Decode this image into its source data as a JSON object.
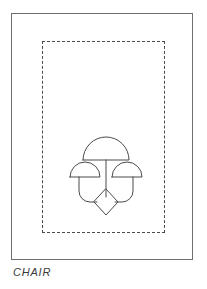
{
  "page": {
    "background_color": "#ffffff",
    "width": 207,
    "height": 289
  },
  "drawing_sheet": {
    "name": "drawing-sheet",
    "border_color": "#6e6e70",
    "border_style": "solid",
    "border_width_px": 1
  },
  "dashed_boundary": {
    "name": "dashed-boundary",
    "border_color": "#4a4a4c",
    "border_style": "dashed",
    "border_width_px": 1,
    "dash_length_px": 9,
    "gap_length_px": 5
  },
  "figure": {
    "name": "chair-icon",
    "stroke_color": "#4a4a4c",
    "fill_color": "none",
    "stroke_width_px": 1,
    "parts": [
      {
        "name": "top-canopy",
        "shape": "semicircle"
      },
      {
        "name": "left-canopy",
        "shape": "semicircle"
      },
      {
        "name": "right-canopy",
        "shape": "semicircle"
      },
      {
        "name": "center-stem",
        "shape": "line"
      },
      {
        "name": "left-stem",
        "shape": "curved-leg"
      },
      {
        "name": "right-stem",
        "shape": "curved-leg"
      },
      {
        "name": "base-diamond",
        "shape": "diamond"
      }
    ]
  },
  "caption": {
    "text": "CHAIR",
    "style": "italic",
    "color": "#3a3a3c"
  }
}
